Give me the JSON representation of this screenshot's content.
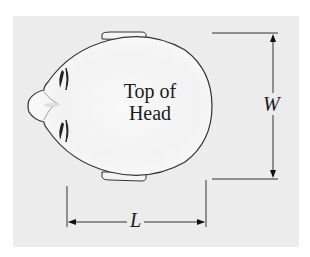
{
  "figure": {
    "center_label_line1": "Top of",
    "center_label_line2": "Head",
    "width_label": "W",
    "length_label": "L"
  },
  "colors": {
    "panel_background": "#ececec",
    "outline": "#333333",
    "head_fill": "#f7f7f7"
  }
}
